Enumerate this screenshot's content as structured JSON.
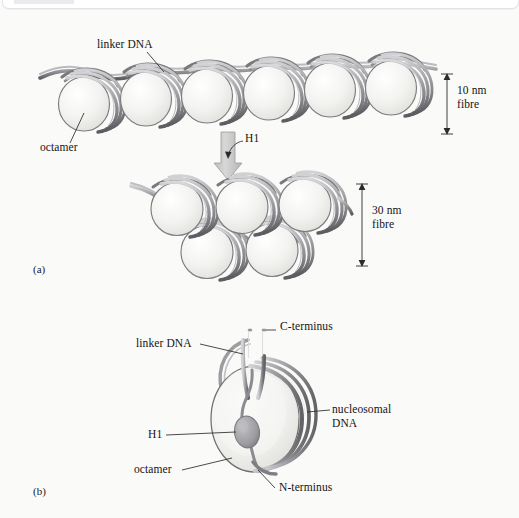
{
  "figure": {
    "background_color": "#fafaf8",
    "ink_color": "#141414",
    "dna_color": "#8e8e92",
    "disc_fill": "#f0f0ee",
    "disc_edge": "#6f6f73",
    "h1_fill": "#9a9a9e",
    "arrow_fill": "#c9c9c9"
  },
  "panels": [
    {
      "id": "panel-a",
      "label": "(a)",
      "x": 33,
      "y": 265
    },
    {
      "id": "panel-b",
      "label": "(b)",
      "x": 33,
      "y": 487
    }
  ],
  "panel_a": {
    "nucleosome_count_10nm": 6,
    "nucleosome_count_30nm_upper": 3,
    "nucleosome_count_30nm_lower": 2,
    "labels": [
      {
        "name": "linker-dna-label-a",
        "text": "linker DNA",
        "x": 97,
        "y": 44
      },
      {
        "name": "octamer-label-a",
        "text": "octamer",
        "x": 40,
        "y": 142
      },
      {
        "name": "h1-label-a",
        "text": "H1",
        "x": 245,
        "y": 139
      }
    ],
    "dimensions": [
      {
        "name": "dimension-10nm",
        "line1": "10 nm",
        "line2": "fibre",
        "axis_x": 447,
        "top_y": 74,
        "bottom_y": 134,
        "text_x": 457,
        "text_y": 91
      },
      {
        "name": "dimension-30nm",
        "line1": "30 nm",
        "line2": "fibre",
        "axis_x": 362,
        "top_y": 184,
        "bottom_y": 266,
        "text_x": 372,
        "text_y": 211
      }
    ],
    "transition_arrow": {
      "name": "h1-transition-arrow",
      "direction": "down",
      "x": 228,
      "top_y": 132,
      "bottom_y": 178
    }
  },
  "panel_b": {
    "labels": [
      {
        "name": "c-terminus-label",
        "text": "C-terminus",
        "x": 280,
        "y": 326
      },
      {
        "name": "linker-dna-label-b",
        "text": "linker DNA",
        "x": 136,
        "y": 340
      },
      {
        "name": "nucleosomal-dna-label",
        "text": "nucleosomal",
        "x": 332,
        "y": 406,
        "text2": "DNA"
      },
      {
        "name": "h1-label-b",
        "text": "H1",
        "x": 148,
        "y": 430
      },
      {
        "name": "octamer-label-b",
        "text": "octamer",
        "x": 134,
        "y": 466
      },
      {
        "name": "n-terminus-label",
        "text": "N-terminus",
        "x": 279,
        "y": 484
      }
    ]
  }
}
